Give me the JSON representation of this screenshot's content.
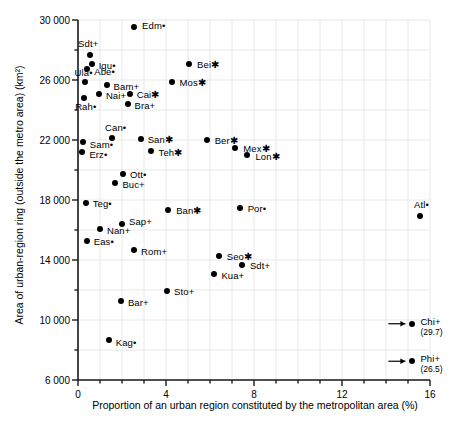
{
  "chart_data": {
    "type": "scatter",
    "title": "",
    "xlabel": "Proportion of an urban region constituted by the metropolitan area (%)",
    "ylabel": "Area of urban-region ring (outside the metro area) (km²)",
    "xlim": [
      0,
      16
    ],
    "ylim": [
      6000,
      30000
    ],
    "xticks": [
      0,
      4,
      8,
      12,
      16
    ],
    "xtick_labels": [
      "0",
      "4",
      "8",
      "12",
      "16"
    ],
    "xminor_step": 1,
    "yticks": [
      6000,
      10000,
      14000,
      18000,
      22000,
      26000,
      30000
    ],
    "ytick_labels": [
      "6 000",
      "10 000",
      "14 000",
      "18 000",
      "22 000",
      "26 000",
      "30 000"
    ],
    "yminor_step": 2000,
    "grid": true,
    "legend": "none",
    "marker_color": "#000000",
    "grid_color": "#e8e8e8",
    "axis_color": "#1a1a1a",
    "points": [
      {
        "label": "Edm•",
        "x": 2.55,
        "y": 29550,
        "lx": 8,
        "ly": -1
      },
      {
        "label": "Sdt+",
        "x": 0.55,
        "y": 27700,
        "lx": -8,
        "ly": -11,
        "align": "left-above"
      },
      {
        "label": "Iqu•",
        "x": 0.62,
        "y": 27100,
        "lx": 7,
        "ly": 2
      },
      {
        "label": "Abe•",
        "x": 0.42,
        "y": 26750,
        "lx": 7,
        "ly": 3
      },
      {
        "label": "Ula•",
        "x": 0.3,
        "y": 25900,
        "lx": -6,
        "ly": -9,
        "align": "left-above"
      },
      {
        "label": "Bam+",
        "x": 1.3,
        "y": 25700,
        "lx": 7,
        "ly": 2
      },
      {
        "label": "Nai+",
        "x": 0.95,
        "y": 25100,
        "lx": 7,
        "ly": 2
      },
      {
        "label": "Rah•",
        "x": 0.28,
        "y": 24800,
        "lx": -5,
        "ly": 9,
        "align": "left-below"
      },
      {
        "label": "Cai✱",
        "x": 2.35,
        "y": 25050,
        "lx": 7,
        "ly": 1
      },
      {
        "label": "Bra+",
        "x": 2.25,
        "y": 24400,
        "lx": 7,
        "ly": 2
      },
      {
        "label": "Bei✱",
        "x": 5.05,
        "y": 27100,
        "lx": 8,
        "ly": 1
      },
      {
        "label": "Mos✱",
        "x": 4.25,
        "y": 25900,
        "lx": 8,
        "ly": 1
      },
      {
        "label": "Can•",
        "x": 1.55,
        "y": 22150,
        "lx": -3,
        "ly": -10,
        "align": "left-above"
      },
      {
        "label": "Sam•",
        "x": 0.22,
        "y": 21900,
        "lx": 7,
        "ly": 3
      },
      {
        "label": "Erz•",
        "x": 0.2,
        "y": 21200,
        "lx": 7,
        "ly": 3
      },
      {
        "label": "San✱",
        "x": 2.85,
        "y": 22100,
        "lx": 7,
        "ly": 1
      },
      {
        "label": "Ber✱",
        "x": 5.85,
        "y": 22000,
        "lx": 8,
        "ly": 1
      },
      {
        "label": "Teh✱",
        "x": 3.3,
        "y": 21300,
        "lx": 8,
        "ly": 2
      },
      {
        "label": "Mex✱",
        "x": 7.15,
        "y": 21500,
        "lx": 8,
        "ly": 1
      },
      {
        "label": "Lon✱",
        "x": 7.7,
        "y": 21000,
        "lx": 8,
        "ly": 2
      },
      {
        "label": "Ott•",
        "x": 2.05,
        "y": 19750,
        "lx": 7,
        "ly": 1
      },
      {
        "label": "Buc+",
        "x": 1.7,
        "y": 19150,
        "lx": 7,
        "ly": 2
      },
      {
        "label": "Teg•",
        "x": 0.35,
        "y": 17800,
        "lx": 7,
        "ly": 1
      },
      {
        "label": "Ban✱",
        "x": 4.1,
        "y": 17350,
        "lx": 8,
        "ly": 1
      },
      {
        "label": "Por•",
        "x": 7.35,
        "y": 17450,
        "lx": 8,
        "ly": 1
      },
      {
        "label": "Atl•",
        "x": 15.55,
        "y": 16950,
        "lx": -2,
        "ly": -11,
        "align": "left-above"
      },
      {
        "label": "Sap+",
        "x": 2.0,
        "y": 16400,
        "lx": 7,
        "ly": -2
      },
      {
        "label": "Nan+",
        "x": 1.0,
        "y": 16050,
        "lx": 7,
        "ly": 2
      },
      {
        "label": "Eas•",
        "x": 0.4,
        "y": 15250,
        "lx": 7,
        "ly": 1
      },
      {
        "label": "Rom+",
        "x": 2.55,
        "y": 14650,
        "lx": 7,
        "ly": 2
      },
      {
        "label": "Seo✱",
        "x": 6.4,
        "y": 14300,
        "lx": 8,
        "ly": 1
      },
      {
        "label": "Sdt+",
        "x": 7.45,
        "y": 13700,
        "lx": 8,
        "ly": 1
      },
      {
        "label": "Kua+",
        "x": 6.2,
        "y": 13100,
        "lx": 7,
        "ly": 2
      },
      {
        "label": "Sto+",
        "x": 4.05,
        "y": 11950,
        "lx": 7,
        "ly": 1
      },
      {
        "label": "Bar+",
        "x": 1.95,
        "y": 11250,
        "lx": 7,
        "ly": 2
      },
      {
        "label": "Kag•",
        "x": 1.4,
        "y": 8650,
        "lx": 7,
        "ly": 3
      },
      {
        "label": "Chi+",
        "x": 15.2,
        "y": 9750,
        "lx": 8,
        "ly": -2,
        "annotation": "(29.7)",
        "arrow": true
      },
      {
        "label": "Phi+",
        "x": 15.2,
        "y": 7250,
        "lx": 8,
        "ly": -2,
        "annotation": "(26.5)",
        "arrow": true
      }
    ]
  }
}
